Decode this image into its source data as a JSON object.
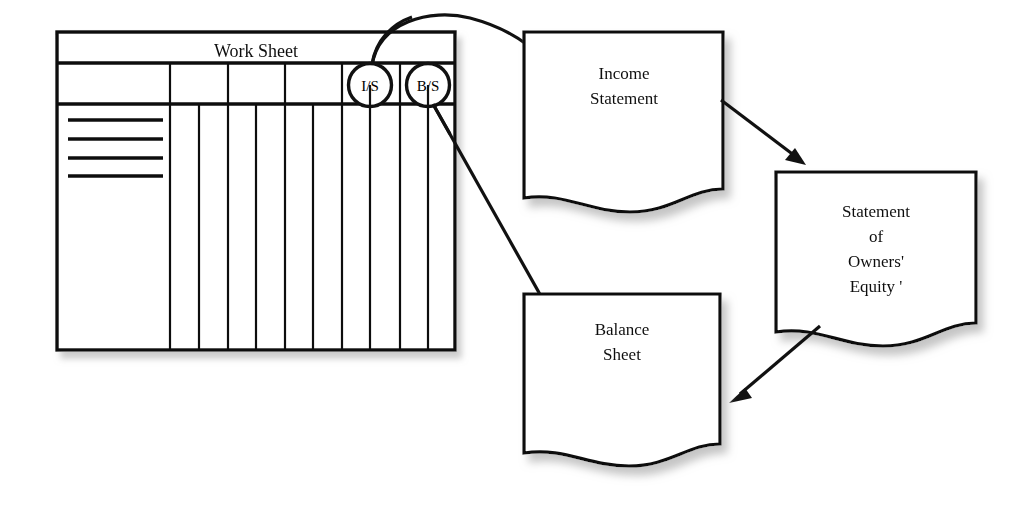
{
  "figure": {
    "background_color": "#ffffff",
    "ink_color": "#111111",
    "shadow_color": "#9b9b9b"
  },
  "worksheet": {
    "title": "Work Sheet",
    "markers": [
      {
        "label": "I/S",
        "name": "income-statement-marker"
      },
      {
        "label": "B/S",
        "name": "balance-sheet-marker"
      }
    ],
    "header_columns": 6,
    "body_columns": 11,
    "account_rules": 4
  },
  "documents": [
    {
      "id": "income-statement",
      "lines": [
        "Income",
        "Statement"
      ]
    },
    {
      "id": "statement-owners-equity",
      "lines": [
        "Statement",
        "of",
        "Owners'",
        "Equity '"
      ]
    },
    {
      "id": "balance-sheet",
      "lines": [
        "Balance",
        "Sheet"
      ]
    }
  ],
  "connectors": [
    {
      "id": "is-marker-to-income-statement",
      "from": "I/S",
      "to": "Income Statement"
    },
    {
      "id": "bs-marker-to-balance-sheet",
      "from": "B/S",
      "to": "Balance Sheet"
    },
    {
      "id": "income-statement-to-owners-equity",
      "from": "Income Statement",
      "to": "Statement of Owners' Equity"
    },
    {
      "id": "owners-equity-to-balance-sheet",
      "from": "Statement of Owners' Equity",
      "to": "Balance Sheet"
    }
  ]
}
